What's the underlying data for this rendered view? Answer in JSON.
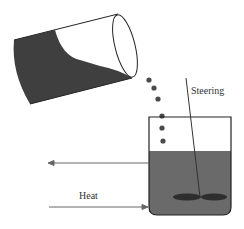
{
  "diagram": {
    "labels": {
      "stirring": "Steering",
      "heat": "Heat"
    },
    "colors": {
      "liquid": "#5e5e5e",
      "liquid_dark": "#3a3a3a",
      "outline": "#222222",
      "arrow": "#666666",
      "paddle": "#2e2e2e"
    },
    "elements": {
      "pouring_beaker": "tilted-cylinder",
      "drops": 6,
      "receiving_beaker": "beaker",
      "stirrer": "paddle-stirrer",
      "arrows": [
        "heat-out-arrow",
        "heat-in-arrow"
      ]
    }
  }
}
